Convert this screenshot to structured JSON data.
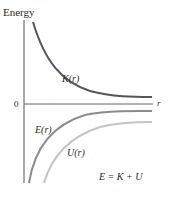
{
  "diagram": {
    "y_axis_label": "Energy",
    "x_axis_label": "r",
    "origin_label": "0",
    "curves": [
      {
        "id": "K",
        "label": "K(r)",
        "color": "#55555c",
        "description": "kinetic energy, positive, decreasing toward 0"
      },
      {
        "id": "E",
        "label": "E(r)",
        "color": "#8c8c8c",
        "description": "total energy, negative, rising toward 0"
      },
      {
        "id": "U",
        "label": "U(r)",
        "color": "#c4c4c4",
        "description": "potential energy, negative, rising toward 0"
      }
    ],
    "equation": "E = K + U",
    "axis_color": "#555555"
  }
}
